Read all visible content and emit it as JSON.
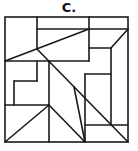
{
  "figure": {
    "label": "C.",
    "stroke_color": "#1a1a1a",
    "background": "#ffffff",
    "outer_box": {
      "x1": 5,
      "y1": 17,
      "x2": 128,
      "y2": 142
    },
    "lines": [
      {
        "x1": 37,
        "y1": 17,
        "x2": 37,
        "y2": 49
      },
      {
        "x1": 37,
        "y1": 29,
        "x2": 128,
        "y2": 29
      },
      {
        "x1": 89,
        "y1": 17,
        "x2": 89,
        "y2": 61
      },
      {
        "x1": 5,
        "y1": 61,
        "x2": 89,
        "y2": 29
      },
      {
        "x1": 5,
        "y1": 61,
        "x2": 89,
        "y2": 61
      },
      {
        "x1": 37,
        "y1": 49,
        "x2": 128,
        "y2": 142
      },
      {
        "x1": 128,
        "y1": 29,
        "x2": 111,
        "y2": 48
      },
      {
        "x1": 89,
        "y1": 48,
        "x2": 111,
        "y2": 48
      },
      {
        "x1": 111,
        "y1": 48,
        "x2": 111,
        "y2": 125
      },
      {
        "x1": 85,
        "y1": 74,
        "x2": 111,
        "y2": 74
      },
      {
        "x1": 85,
        "y1": 74,
        "x2": 85,
        "y2": 142
      },
      {
        "x1": 85,
        "y1": 125,
        "x2": 128,
        "y2": 125
      },
      {
        "x1": 37,
        "y1": 61,
        "x2": 37,
        "y2": 81
      },
      {
        "x1": 14,
        "y1": 81,
        "x2": 37,
        "y2": 81
      },
      {
        "x1": 14,
        "y1": 81,
        "x2": 14,
        "y2": 105
      },
      {
        "x1": 49,
        "y1": 61,
        "x2": 49,
        "y2": 142
      },
      {
        "x1": 5,
        "y1": 105,
        "x2": 49,
        "y2": 105
      },
      {
        "x1": 49,
        "y1": 105,
        "x2": 5,
        "y2": 142
      },
      {
        "x1": 49,
        "y1": 105,
        "x2": 85,
        "y2": 142
      },
      {
        "x1": 74,
        "y1": 87,
        "x2": 85,
        "y2": 142
      }
    ]
  }
}
